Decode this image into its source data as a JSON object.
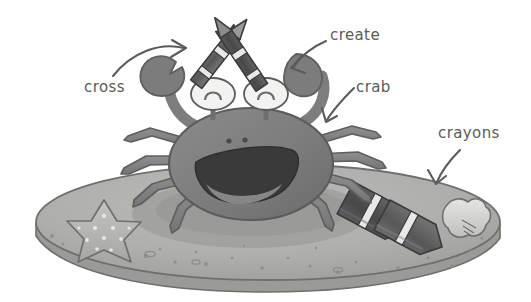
{
  "image": {
    "title": "Cartoon crab holding crossed crayons on a sand mound",
    "style": "grayscale hand-drawn illustration with handwritten annotation labels",
    "width": 531,
    "height": 302,
    "background_color": "#ffffff"
  },
  "annotations": [
    {
      "id": "cross",
      "label": "cross",
      "x": 84,
      "y": 80,
      "points_to": "crossed-crayons"
    },
    {
      "id": "create",
      "label": "create",
      "x": 330,
      "y": 28,
      "points_to": "crab-claw-right"
    },
    {
      "id": "crab",
      "label": "crab",
      "x": 356,
      "y": 80,
      "points_to": "crab-body"
    },
    {
      "id": "crayons",
      "label": "crayons",
      "x": 438,
      "y": 126,
      "points_to": "sand-crayons"
    }
  ],
  "objects": [
    {
      "name": "sand-mound",
      "description": "large oval mound of sand with speckles"
    },
    {
      "name": "crab",
      "description": "smiling crab with eyes on stalks, eight legs and two claws"
    },
    {
      "name": "crab-mouth",
      "description": "wide open smiling mouth"
    },
    {
      "name": "crossed-crayons",
      "description": "two crayons crossed in an X held above the crab"
    },
    {
      "name": "starfish",
      "description": "five-point starfish with light dots"
    },
    {
      "name": "sand-crayons",
      "description": "two crayons lying on the sand"
    },
    {
      "name": "seashell",
      "description": "small clam seashell on the sand"
    }
  ],
  "colors": {
    "background": "#ffffff",
    "sand_light": "#b3b3b0",
    "sand_mid": "#a3a3a0",
    "sand_shadow": "#949492",
    "sand_edge": "#8f8f8d",
    "crab_body": "#7e7e7e",
    "crab_dark": "#6e6e6e",
    "crab_limb": "#8a8a8a",
    "mouth": "#3a3a3a",
    "eye_white": "#f2f2f0",
    "crayon_dark": "#4a4a4a",
    "crayon_mid": "#676767",
    "crayon_band": "#e8e8e6",
    "outline": "#5b5b5b",
    "label_text": "#5b5b5b"
  }
}
